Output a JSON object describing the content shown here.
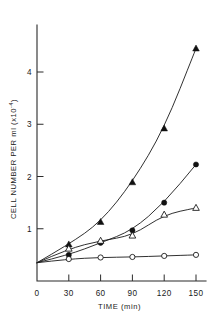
{
  "chart_data": {
    "type": "line",
    "title": "",
    "subtitle": "",
    "xlabel": "TIME (min)",
    "xlabel_parts": {
      "name": "TIME",
      "units": "(min)"
    },
    "ylabel": "CELL NUMBER PER ml (x10-4)",
    "ylabel_parts": {
      "name": "CELL NUMBER PER ml",
      "open_paren": "(",
      "multiplier": "x10",
      "exponent": "-4",
      "close_paren": ")"
    },
    "x": [
      0,
      30,
      60,
      90,
      120,
      150
    ],
    "xlim": [
      0,
      162
    ],
    "ylim": [
      0,
      4.7
    ],
    "xticks": [
      0,
      30,
      60,
      90,
      120,
      150
    ],
    "xticklabels": [
      "0",
      "30",
      "60",
      "90",
      "120",
      "150"
    ],
    "yticks": [
      1,
      2,
      3,
      4
    ],
    "yticklabels": [
      "1",
      "2",
      "3",
      "4"
    ],
    "grid": false,
    "legend": "none",
    "series": [
      {
        "name": "filled-triangle-series",
        "marker": "filled-triangle",
        "color": "#111111",
        "values": [
          0.35,
          0.7,
          1.13,
          1.89,
          2.92,
          4.45
        ]
      },
      {
        "name": "filled-circle-series",
        "marker": "filled-circle",
        "color": "#111111",
        "values": [
          0.35,
          0.5,
          0.73,
          0.97,
          1.5,
          2.23
        ]
      },
      {
        "name": "open-triangle-series",
        "marker": "open-triangle",
        "color": "#111111",
        "values": [
          0.35,
          0.62,
          0.77,
          0.87,
          1.27,
          1.4
        ]
      },
      {
        "name": "open-circle-series",
        "marker": "open-circle",
        "color": "#111111",
        "values": [
          0.35,
          0.42,
          0.45,
          0.46,
          0.48,
          0.5
        ]
      }
    ]
  }
}
